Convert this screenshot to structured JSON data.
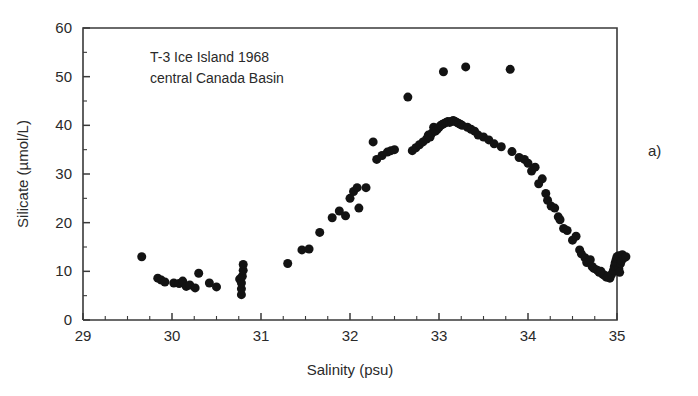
{
  "figure": {
    "panel_label": "a)",
    "annotation_lines": [
      "T-3 Ice Island 1968",
      "central Canada Basin"
    ],
    "point_color": "#131313",
    "axis_color": "#3a3a3a",
    "background": "#ffffff"
  },
  "chart_data": {
    "type": "scatter",
    "title": "",
    "subtitle": "",
    "annotation": "T-3 Ice Island 1968\ncentral Canada Basin",
    "xlabel": "Salinity (psu)",
    "ylabel": "Silicate (µmol/L)",
    "xlim": [
      29,
      35
    ],
    "ylim": [
      0,
      60
    ],
    "xticks": [
      29,
      30,
      31,
      32,
      33,
      34,
      35
    ],
    "yticks": [
      0,
      10,
      20,
      30,
      40,
      50,
      60
    ],
    "xtick_labels": [
      "29",
      "30",
      "31",
      "32",
      "33",
      "34",
      "35"
    ],
    "ytick_labels": [
      "0",
      "10",
      "20",
      "30",
      "40",
      "50",
      "60"
    ],
    "x_minor_interval": 0.25,
    "y_minor_interval": 5,
    "grid": false,
    "legend": null,
    "marker": "filled-circle",
    "marker_size_px": 9,
    "series": [
      {
        "name": "Silicate vs Salinity",
        "x": [
          29.66,
          29.84,
          29.88,
          29.92,
          30.02,
          30.08,
          30.12,
          30.16,
          30.2,
          30.26,
          30.3,
          30.42,
          30.5,
          30.76,
          30.78,
          30.78,
          30.78,
          30.79,
          30.8,
          30.8,
          31.3,
          31.46,
          31.54,
          31.66,
          31.8,
          31.88,
          31.95,
          32.0,
          32.04,
          32.08,
          32.1,
          32.18,
          32.26,
          32.3,
          32.36,
          32.42,
          32.46,
          32.5,
          32.65,
          32.7,
          32.74,
          32.78,
          32.82,
          32.86,
          32.88,
          32.9,
          32.92,
          32.94,
          32.96,
          32.98,
          33.0,
          33.02,
          33.04,
          33.05,
          33.06,
          33.08,
          33.1,
          33.12,
          33.14,
          33.16,
          33.18,
          33.2,
          33.22,
          33.24,
          33.26,
          33.3,
          33.32,
          33.36,
          33.4,
          33.44,
          33.5,
          33.56,
          33.62,
          33.7,
          33.8,
          33.82,
          33.9,
          33.96,
          34.0,
          34.04,
          34.08,
          34.12,
          34.16,
          34.2,
          34.22,
          34.26,
          34.3,
          34.34,
          34.36,
          34.4,
          34.44,
          34.5,
          34.54,
          34.58,
          34.6,
          34.64,
          34.66,
          34.7,
          34.72,
          34.74,
          34.78,
          34.8,
          34.82,
          34.84,
          34.86,
          34.88,
          34.9,
          34.92,
          34.94,
          34.96,
          34.97,
          34.98,
          34.99,
          35.0,
          35.0,
          35.01,
          35.02,
          35.02,
          35.03,
          35.04,
          35.05,
          35.06,
          35.08,
          35.1
        ],
        "y": [
          13.0,
          8.6,
          8.2,
          7.8,
          7.6,
          7.5,
          8.0,
          6.9,
          7.2,
          6.6,
          9.6,
          7.6,
          6.8,
          8.4,
          5.2,
          6.4,
          7.6,
          9.0,
          10.2,
          11.4,
          11.6,
          14.4,
          14.6,
          18.0,
          21.0,
          22.4,
          21.4,
          25.0,
          26.4,
          27.2,
          23.0,
          27.2,
          36.6,
          33.0,
          33.8,
          34.5,
          34.8,
          35.0,
          45.8,
          34.8,
          35.4,
          36.0,
          36.6,
          37.2,
          38.0,
          37.6,
          38.4,
          39.6,
          38.8,
          39.2,
          39.6,
          40.0,
          40.2,
          51.0,
          40.4,
          40.6,
          40.8,
          40.6,
          40.8,
          41.0,
          40.8,
          40.6,
          40.4,
          40.2,
          40.0,
          52.0,
          39.6,
          39.2,
          38.8,
          38.0,
          37.6,
          37.0,
          36.2,
          35.6,
          51.5,
          34.6,
          33.4,
          33.0,
          32.2,
          30.6,
          31.4,
          28.0,
          29.0,
          26.0,
          24.6,
          23.4,
          23.0,
          21.2,
          20.6,
          18.8,
          18.4,
          16.4,
          17.2,
          14.4,
          13.6,
          12.8,
          11.8,
          12.4,
          11.0,
          10.6,
          10.2,
          9.8,
          10.0,
          9.4,
          9.2,
          8.8,
          9.0,
          8.6,
          9.4,
          10.2,
          11.0,
          11.8,
          12.4,
          13.0,
          11.4,
          12.6,
          13.2,
          10.6,
          9.8,
          11.6,
          12.2,
          13.4,
          12.8,
          13.0
        ]
      }
    ]
  }
}
